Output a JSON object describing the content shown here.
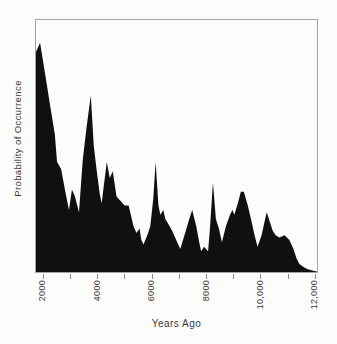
{
  "figure": {
    "background_color": "#fcfcfb",
    "box_border_color": "#a3a3a3",
    "area_fill_color": "#101010",
    "tick_color": "#8a8a8a",
    "text_color": "#3a3a3a"
  },
  "chart_data": {
    "type": "area",
    "title": "",
    "xlabel": "Years Ago",
    "ylabel": "Probability of Occurrence",
    "xlim": [
      1700,
      12100
    ],
    "ylim": [
      0,
      1
    ],
    "grid": false,
    "legend": false,
    "y_ticks": [],
    "x_ticks": [
      {
        "value": 2000,
        "label": "2000"
      },
      {
        "value": 3000,
        "label": ""
      },
      {
        "value": 4000,
        "label": "4000"
      },
      {
        "value": 5000,
        "label": ""
      },
      {
        "value": 6000,
        "label": "6000"
      },
      {
        "value": 7000,
        "label": ""
      },
      {
        "value": 8000,
        "label": "8000"
      },
      {
        "value": 9000,
        "label": ""
      },
      {
        "value": 10000,
        "label": "10,000"
      },
      {
        "value": 11000,
        "label": ""
      },
      {
        "value": 12000,
        "label": "12,000"
      }
    ],
    "series": [
      {
        "name": "probability-of-occurrence-density",
        "points": [
          [
            1700,
            0.96
          ],
          [
            1850,
            1.0
          ],
          [
            2040,
            0.86
          ],
          [
            2260,
            0.7
          ],
          [
            2400,
            0.6
          ],
          [
            2480,
            0.48
          ],
          [
            2630,
            0.45
          ],
          [
            2770,
            0.36
          ],
          [
            2920,
            0.27
          ],
          [
            3030,
            0.36
          ],
          [
            3140,
            0.33
          ],
          [
            3290,
            0.26
          ],
          [
            3430,
            0.49
          ],
          [
            3580,
            0.64
          ],
          [
            3730,
            0.77
          ],
          [
            3840,
            0.55
          ],
          [
            3950,
            0.44
          ],
          [
            4060,
            0.34
          ],
          [
            4130,
            0.3
          ],
          [
            4320,
            0.48
          ],
          [
            4430,
            0.41
          ],
          [
            4540,
            0.44
          ],
          [
            4680,
            0.33
          ],
          [
            4830,
            0.31
          ],
          [
            4980,
            0.29
          ],
          [
            5130,
            0.29
          ],
          [
            5310,
            0.2
          ],
          [
            5420,
            0.17
          ],
          [
            5530,
            0.19
          ],
          [
            5600,
            0.14
          ],
          [
            5680,
            0.12
          ],
          [
            5820,
            0.16
          ],
          [
            5930,
            0.2
          ],
          [
            6040,
            0.32
          ],
          [
            6130,
            0.48
          ],
          [
            6230,
            0.29
          ],
          [
            6300,
            0.25
          ],
          [
            6410,
            0.27
          ],
          [
            6490,
            0.23
          ],
          [
            6600,
            0.21
          ],
          [
            6740,
            0.18
          ],
          [
            6890,
            0.14
          ],
          [
            7040,
            0.1
          ],
          [
            7220,
            0.17
          ],
          [
            7370,
            0.23
          ],
          [
            7480,
            0.27
          ],
          [
            7630,
            0.2
          ],
          [
            7740,
            0.13
          ],
          [
            7810,
            0.09
          ],
          [
            7920,
            0.11
          ],
          [
            7990,
            0.1
          ],
          [
            8070,
            0.09
          ],
          [
            8140,
            0.19
          ],
          [
            8250,
            0.39
          ],
          [
            8360,
            0.23
          ],
          [
            8470,
            0.19
          ],
          [
            8580,
            0.13
          ],
          [
            8730,
            0.2
          ],
          [
            8880,
            0.25
          ],
          [
            8970,
            0.27
          ],
          [
            9040,
            0.25
          ],
          [
            9170,
            0.3
          ],
          [
            9280,
            0.35
          ],
          [
            9390,
            0.35
          ],
          [
            9540,
            0.29
          ],
          [
            9680,
            0.22
          ],
          [
            9790,
            0.16
          ],
          [
            9900,
            0.11
          ],
          [
            10050,
            0.16
          ],
          [
            10160,
            0.22
          ],
          [
            10240,
            0.26
          ],
          [
            10350,
            0.22
          ],
          [
            10460,
            0.18
          ],
          [
            10570,
            0.16
          ],
          [
            10710,
            0.15
          ],
          [
            10900,
            0.16
          ],
          [
            11080,
            0.14
          ],
          [
            11230,
            0.1
          ],
          [
            11340,
            0.06
          ],
          [
            11450,
            0.035
          ],
          [
            11600,
            0.022
          ],
          [
            11740,
            0.013
          ],
          [
            11890,
            0.008
          ],
          [
            12000,
            0.004
          ],
          [
            12100,
            0.002
          ]
        ]
      }
    ]
  }
}
